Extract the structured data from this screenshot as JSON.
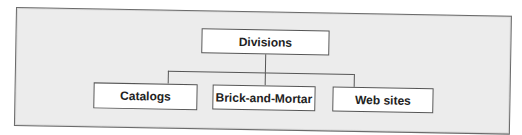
{
  "diagram": {
    "type": "org-chart",
    "root": {
      "label": "Divisions"
    },
    "children": [
      {
        "label": "Catalogs"
      },
      {
        "label": "Brick-and-Mortar"
      },
      {
        "label": "Web sites"
      }
    ]
  },
  "colors": {
    "background": "#ececec",
    "box_fill": "#ffffff",
    "stroke": "#555555"
  }
}
